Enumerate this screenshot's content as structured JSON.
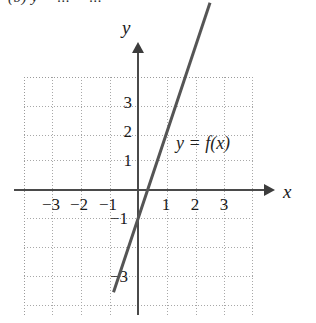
{
  "figure": {
    "cropped_header_text": "(b)  y = ... = ...",
    "function_label": "y = f(x)",
    "axis_labels": {
      "x": "x",
      "y": "y"
    }
  },
  "chart_data": {
    "type": "line",
    "title": "",
    "xlabel": "x",
    "ylabel": "y",
    "xlim": [
      -4,
      4
    ],
    "ylim": [
      -4.2,
      4.2
    ],
    "grid": true,
    "grid_step": 1,
    "legend": "none",
    "annotations": [
      {
        "text": "y = f(x)",
        "x": 1.35,
        "y": 1.55
      }
    ],
    "x_ticks": [
      -3,
      -2,
      -1,
      1,
      2,
      3
    ],
    "x_tick_labels": [
      "−3",
      "−2",
      "−1",
      "1",
      "2",
      "3"
    ],
    "y_ticks": [
      3,
      2,
      1,
      -1,
      -3
    ],
    "y_tick_labels": [
      "3",
      "2",
      "1",
      "−1",
      "−3"
    ],
    "series": [
      {
        "name": "f(x)",
        "expression": "y = 3x - 1",
        "slope": 3,
        "intercept": -1,
        "color": "#555555",
        "line_width": 3,
        "x": [
          -0.85,
          2.5
        ],
        "values": [
          -3.55,
          6.5
        ],
        "x_intercept": 0.333,
        "y_intercept": -1
      }
    ]
  }
}
